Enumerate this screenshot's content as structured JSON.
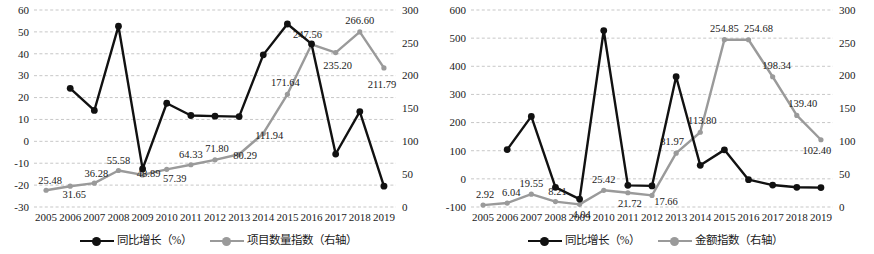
{
  "figure": {
    "panels": [
      {
        "id": "left-panel",
        "name": "project-count-index-chart",
        "legend": [
          {
            "label": "同比增长（%）",
            "color": "#111111",
            "icon": "line-marker-black"
          },
          {
            "label": "项目数量指数（右轴）",
            "color": "#9a9a9a",
            "icon": "line-marker-gray"
          }
        ]
      },
      {
        "id": "right-panel",
        "name": "amount-index-chart",
        "legend": [
          {
            "label": "同比增长（%）",
            "color": "#111111",
            "icon": "line-marker-black"
          },
          {
            "label": "金额指数（右轴）",
            "color": "#9a9a9a",
            "icon": "line-marker-gray"
          }
        ]
      }
    ]
  },
  "chart_data": [
    {
      "type": "line",
      "id": "project-count-index",
      "title": "",
      "xlabel": "",
      "ylabel": "",
      "grid": true,
      "legend_position": "bottom",
      "categories": [
        2005,
        2006,
        2007,
        2008,
        2009,
        2010,
        2011,
        2012,
        2013,
        2014,
        2015,
        2016,
        2017,
        2018,
        2019
      ],
      "xticklabels": [
        "2005",
        "2006",
        "2007",
        "2008",
        "2009",
        "2010",
        "2011",
        "2012",
        "2013",
        "2014",
        "2015",
        "2016",
        "2017",
        "2018",
        "2019"
      ],
      "left_axis": {
        "ylim": [
          -30,
          60
        ],
        "ticks": [
          -30,
          -20,
          -10,
          0,
          10,
          20,
          30,
          40,
          50,
          60
        ],
        "ticklabels": [
          "-30",
          "-20",
          "-10",
          "0",
          "10",
          "20",
          "30",
          "40",
          "50",
          "60"
        ]
      },
      "right_axis": {
        "ylim": [
          0,
          300
        ],
        "ticks": [
          0,
          50,
          100,
          150,
          200,
          250,
          300
        ],
        "ticklabels": [
          "0",
          "50",
          "100",
          "150",
          "200",
          "250",
          "300"
        ]
      },
      "series": [
        {
          "name": "同比增长（%）",
          "axis": "left",
          "color": "#111111",
          "values": [
            null,
            24.2,
            14.1,
            52.6,
            -12.6,
            17.4,
            11.8,
            11.5,
            11.3,
            39.5,
            53.6,
            44.5,
            -5.8,
            13.6,
            -20.5
          ],
          "labels": [
            null,
            null,
            null,
            null,
            null,
            null,
            null,
            null,
            null,
            null,
            null,
            null,
            null,
            null,
            null
          ]
        },
        {
          "name": "项目数量指数（右轴）",
          "axis": "right",
          "color": "#9a9a9a",
          "values": [
            25.48,
            31.65,
            36.28,
            55.58,
            48.89,
            57.39,
            64.33,
            71.8,
            80.29,
            111.94,
            171.64,
            247.56,
            235.2,
            266.6,
            211.79
          ],
          "labels": [
            "25.48",
            "31.65",
            "36.28",
            "55.58",
            "48.89",
            "57.39",
            "64.33",
            "71.80",
            "80.29",
            "111.94",
            "171.64",
            "247.56",
            "235.20",
            "266.60",
            "211.79"
          ]
        }
      ]
    },
    {
      "type": "line",
      "id": "amount-index",
      "title": "",
      "xlabel": "",
      "ylabel": "",
      "grid": true,
      "legend_position": "bottom",
      "categories": [
        2005,
        2006,
        2007,
        2008,
        2009,
        2010,
        2011,
        2012,
        2013,
        2014,
        2015,
        2016,
        2017,
        2018,
        2019
      ],
      "xticklabels": [
        "2005",
        "2006",
        "2007",
        "2008",
        "2009",
        "2010",
        "2011",
        "2012",
        "2013",
        "2014",
        "2015",
        "2016",
        "2017",
        "2018",
        "2019"
      ],
      "left_axis": {
        "ylim": [
          -100,
          600
        ],
        "ticks": [
          -100,
          0,
          100,
          200,
          300,
          400,
          500,
          600
        ],
        "ticklabels": [
          "-100",
          "0",
          "100",
          "200",
          "300",
          "400",
          "500",
          "600"
        ]
      },
      "right_axis": {
        "ylim": [
          0,
          300
        ],
        "ticks": [
          0,
          50,
          100,
          150,
          200,
          250,
          300
        ],
        "ticklabels": [
          "0",
          "50",
          "100",
          "150",
          "200",
          "250",
          "300"
        ]
      },
      "series": [
        {
          "name": "同比增长（%）",
          "axis": "left",
          "color": "#111111",
          "values": [
            null,
            104,
            222,
            -30,
            -72,
            527,
            -23,
            -25,
            363,
            48,
            103,
            -3,
            -22,
            -30,
            -31
          ],
          "labels": [
            null,
            null,
            null,
            null,
            null,
            null,
            null,
            null,
            null,
            null,
            null,
            null,
            null,
            null,
            null
          ]
        },
        {
          "name": "金额指数（右轴）",
          "axis": "right",
          "color": "#9a9a9a",
          "values": [
            2.92,
            6.04,
            19.55,
            8.21,
            4.04,
            25.42,
            21.72,
            17.66,
            81.97,
            113.8,
            254.85,
            254.68,
            198.34,
            139.4,
            102.4
          ],
          "labels": [
            "2.92",
            "6.04",
            "19.55",
            "8.21",
            "4.04",
            "25.42",
            "21.72",
            "17.66",
            "81.97",
            "113.80",
            "254.85",
            "254.68",
            "198.34",
            "139.40",
            "102.40"
          ]
        }
      ]
    }
  ]
}
